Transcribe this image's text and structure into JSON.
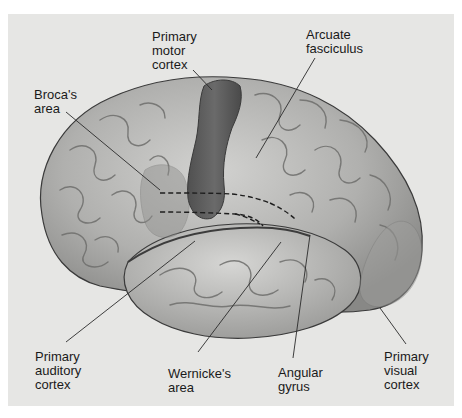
{
  "figure": {
    "colors": {
      "background": "#ffffff",
      "panel": "#e6e6e4",
      "brain_base": "#b4b4b2",
      "brain_highlight": "#e4e4e2",
      "brain_shadow": "#707070",
      "motor_cortex": "#5e5e5e",
      "broca_area": "#9a9a98",
      "visual_cortex": "#a6a6a4",
      "leader_line": "#2a2a2a",
      "dashed_tract": "#1e1e1e"
    }
  },
  "labels": {
    "primary_motor_cortex": "Primary\nmotor\ncortex",
    "arcuate_fasciculus": "Arcuate\nfasciculus",
    "brocas_area": "Broca's\narea",
    "primary_auditory_cortex": "Primary\nauditory\ncortex",
    "wernickes_area": "Wernicke's\narea",
    "angular_gyrus": "Angular\ngyrus",
    "primary_visual_cortex": "Primary\nvisual\ncortex"
  }
}
